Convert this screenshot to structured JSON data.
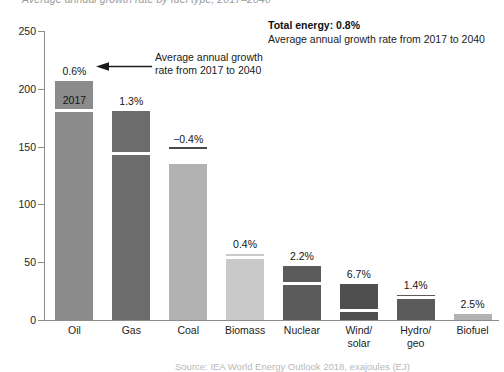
{
  "title": "Average annual growth rate by fuel type, 2017–2040",
  "note": {
    "headline": "Total energy: 0.8%",
    "subline": "Average annual growth rate from 2017 to 2040"
  },
  "annotation": {
    "line1": "Average annual growth",
    "line2": "rate from 2017 to 2040",
    "arrow_icon": "left-arrow-icon"
  },
  "footer": "Source: IEA World Energy Outlook 2018, exajoules (EJ)",
  "axis": {
    "y_ticks": [
      "0",
      "50",
      "100",
      "150",
      "200",
      "250"
    ],
    "y_min": 0,
    "y_max": 250
  },
  "segment_label_2017": "2017",
  "chart_data": {
    "type": "bar",
    "title": "Average annual growth rate by fuel type, 2017–2040",
    "xlabel": "",
    "ylabel": "",
    "ylim": [
      0,
      250
    ],
    "grid": false,
    "legend": "none",
    "categories": [
      "Oil",
      "Gas",
      "Coal",
      "Biomass",
      "Nuclear",
      "Wind/ solar",
      "Hydro/ geo",
      "Biofuel"
    ],
    "category_lines": [
      [
        "Oil"
      ],
      [
        "Gas"
      ],
      [
        "Coal"
      ],
      [
        "Biomass"
      ],
      [
        "Nuclear"
      ],
      [
        "Wind/",
        "solar"
      ],
      [
        "Hydro/",
        "geo"
      ],
      [
        "Biofuel"
      ]
    ],
    "series": [
      {
        "name": "2040 total",
        "values": [
          207,
          181,
          135,
          57,
          47,
          31,
          22,
          5
        ]
      },
      {
        "name": "2017",
        "values": [
          180,
          143,
          148,
          53,
          30,
          7,
          18,
          4
        ]
      }
    ],
    "growth_rate_labels": [
      "0.6%",
      "1.3%",
      "−0.4%",
      "0.4%",
      "2.2%",
      "6.7%",
      "1.4%",
      "2.5%"
    ],
    "growth_rates": [
      0.6,
      1.3,
      -0.4,
      0.4,
      2.2,
      6.7,
      1.4,
      2.5
    ],
    "total_energy_growth_rate": "0.8%",
    "bar_colors": [
      "#8b8b8b",
      "#6c6c6c",
      "#b2b2b2",
      "#c9c9c9",
      "#5b5b5b",
      "#4f4f4f",
      "#5b5b5b",
      "#b2b2b2"
    ]
  }
}
